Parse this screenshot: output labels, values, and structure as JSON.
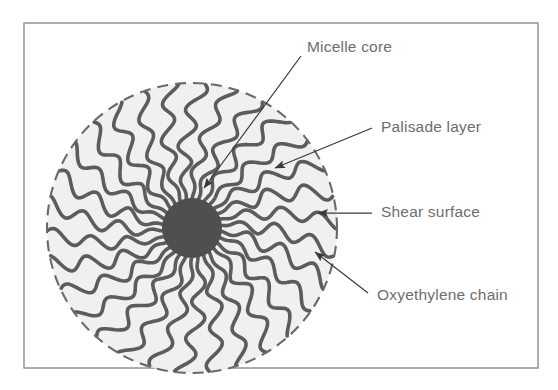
{
  "figure": {
    "type": "schematic-diagram",
    "frame": {
      "x": 24,
      "y": 23,
      "width": 514,
      "height": 345,
      "border_color": "#8c8c8c"
    },
    "background_color": "#ffffff"
  },
  "micelle": {
    "center_x": 192,
    "center_y": 228,
    "outer_radius": 145,
    "core_radius": 30,
    "interior_fill": "#f0f0f0",
    "chain_color": "#5c5c5c",
    "core_color": "#4f4f4f",
    "boundary_style": "dashed",
    "boundary_color": "#6a6a6a",
    "chain_count": 30,
    "chain_wave_cycles": 3.2,
    "chain_spiral_twist_deg": 16
  },
  "labels": [
    {
      "id": "micelle-core",
      "text": "Micelle core",
      "text_x": 307,
      "text_y": 48,
      "arrow_from_x": 301,
      "arrow_from_y": 56,
      "arrow_to_x": 204,
      "arrow_to_y": 188,
      "points_to": "core"
    },
    {
      "id": "palisade-layer",
      "text": "Palisade layer",
      "text_x": 381,
      "text_y": 128,
      "arrow_from_x": 372,
      "arrow_from_y": 128,
      "arrow_to_x": 275,
      "arrow_to_y": 168,
      "points_to": "palisade"
    },
    {
      "id": "shear-surface",
      "text": "Shear surface",
      "text_x": 381,
      "text_y": 213,
      "arrow_from_x": 372,
      "arrow_from_y": 213,
      "arrow_to_x": 318,
      "arrow_to_y": 213,
      "points_to": "shear-surface"
    },
    {
      "id": "oxyethylene-chain",
      "text": "Oxyethylene chain",
      "text_x": 377,
      "text_y": 296,
      "arrow_from_x": 368,
      "arrow_from_y": 293,
      "arrow_to_x": 315,
      "arrow_to_y": 252,
      "points_to": "chain"
    }
  ],
  "colors": {
    "text": "#6e6e6e",
    "arrow": "#3a3a3a",
    "core": "#4f4f4f",
    "chain": "#5c5c5c",
    "fill": "#f0f0f0",
    "frame": "#8c8c8c"
  }
}
